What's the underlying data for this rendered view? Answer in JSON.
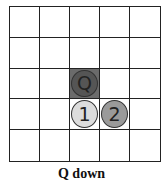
{
  "grid": {
    "rows": 5,
    "cols": 5
  },
  "shaded_cells": [
    {
      "row": 2,
      "col": 2,
      "color": "#6b6b6b"
    }
  ],
  "pieces": [
    {
      "label": "Q",
      "row": 2,
      "col": 2,
      "fill": "#555555"
    },
    {
      "label": "1",
      "row": 3,
      "col": 2,
      "fill": "#dcdcdc"
    },
    {
      "label": "2",
      "row": 3,
      "col": 3,
      "fill": "#9a9a9a"
    }
  ],
  "caption": "Q down"
}
